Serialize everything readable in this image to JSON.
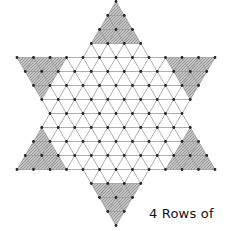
{
  "diagram": {
    "caption": "4 Rows of",
    "rows": 17,
    "row_hole_counts": [
      1,
      2,
      3,
      4,
      13,
      12,
      11,
      10,
      9,
      10,
      11,
      12,
      13,
      4,
      3,
      2,
      1
    ],
    "total_holes": 121,
    "corner_rows": 4,
    "shaded_corners": [
      "top",
      "top-left",
      "top-right",
      "bottom-left",
      "bottom-right",
      "bottom"
    ],
    "colors": {
      "line": "#9a9a9a",
      "hole": "#222222",
      "shade": "#b9b9b9",
      "hatch": "#666666"
    }
  }
}
